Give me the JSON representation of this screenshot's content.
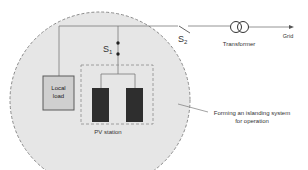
{
  "diagram": {
    "type": "islanded PV microgrid schematic",
    "labels": {
      "switch_s1": "S",
      "switch_s1_sub": "1",
      "switch_s2": "S",
      "switch_s2_sub": "2",
      "transformer": "Transformer",
      "grid": "Grid",
      "local_load_line1": "Local",
      "local_load_line2": "load",
      "pv_station": "PV station",
      "annotation_line1": "Forming an islanding system",
      "annotation_line2": "for operation"
    },
    "colors": {
      "island_fill": "#e6e6e6",
      "island_border": "#8a8a8a",
      "line": "#7a7a7a",
      "load_fill": "#cfcfcf",
      "load_border": "#5a5a5a",
      "pv_panel": "#2e2e2e",
      "text": "#333333"
    },
    "components": [
      {
        "id": "island-boundary",
        "shape": "dashed-circle"
      },
      {
        "id": "switch-s1",
        "kind": "closed switch"
      },
      {
        "id": "switch-s2",
        "kind": "open switch"
      },
      {
        "id": "transformer",
        "kind": "two-winding transformer"
      },
      {
        "id": "local-load",
        "kind": "load box"
      },
      {
        "id": "pv-station",
        "kind": "dashed enclosure with two PV panels"
      }
    ]
  }
}
